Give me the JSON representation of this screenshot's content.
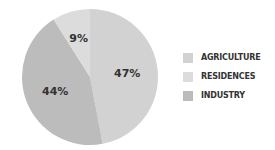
{
  "chart_data": {
    "type": "pie",
    "title": "",
    "categories": [
      "AGRICULTURE",
      "RESIDENCES",
      "INDUSTRY"
    ],
    "values": [
      47,
      9,
      44
    ],
    "labels": [
      "47%",
      "9%",
      "44%"
    ],
    "colors": [
      "#d2d2d2",
      "#dcdcdc",
      "#bcbcbc"
    ],
    "legend_position": "right"
  },
  "legend": {
    "items": [
      {
        "label": "AGRICULTURE",
        "color": "#d2d2d2"
      },
      {
        "label": "RESIDENCES",
        "color": "#dcdcdc"
      },
      {
        "label": "INDUSTRY",
        "color": "#bcbcbc"
      }
    ]
  }
}
